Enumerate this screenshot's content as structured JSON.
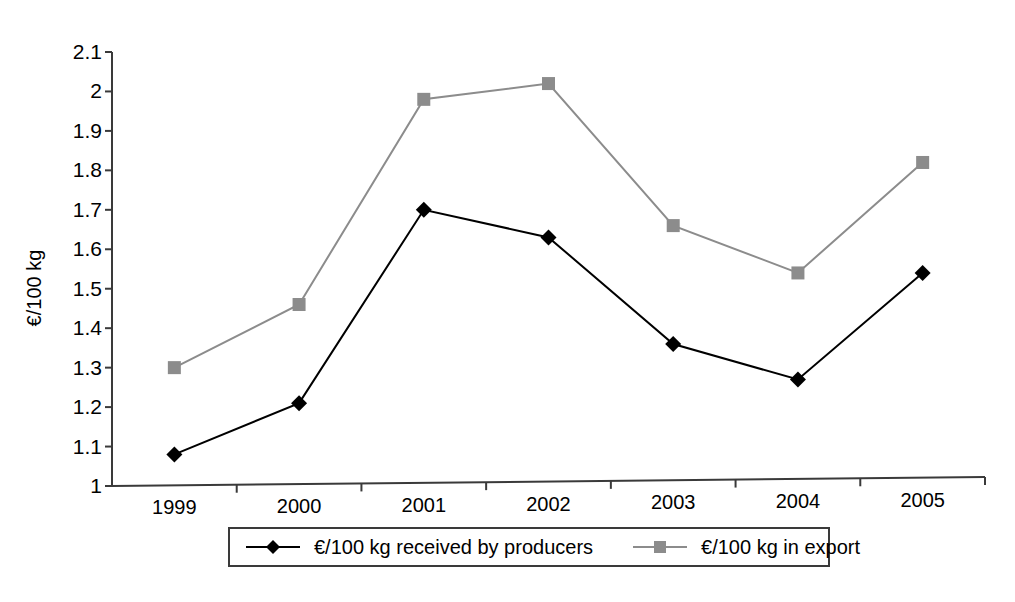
{
  "chart_data": {
    "type": "line",
    "title": "",
    "xlabel": "",
    "ylabel": "€/100 kg",
    "categories": [
      "1999",
      "2000",
      "2001",
      "2002",
      "2003",
      "2004",
      "2005"
    ],
    "ylim": [
      1,
      2.1
    ],
    "ytick_labels": [
      "1",
      "1.1",
      "1.2",
      "1.3",
      "1.4",
      "1.5",
      "1.6",
      "1.7",
      "1.8",
      "1.9",
      "2",
      "2.1"
    ],
    "ytick_values": [
      1,
      1.1,
      1.2,
      1.3,
      1.4,
      1.5,
      1.6,
      1.7,
      1.8,
      1.9,
      2.0,
      2.1
    ],
    "grid": false,
    "legend_position": "bottom",
    "series": [
      {
        "name": "€/100 kg received by producers",
        "marker": "diamond",
        "color": "#000000",
        "values": [
          1.08,
          1.21,
          1.7,
          1.63,
          1.36,
          1.27,
          1.54
        ]
      },
      {
        "name": "€/100 kg in export",
        "marker": "square",
        "color": "#8c8c8c",
        "values": [
          1.3,
          1.46,
          1.98,
          2.02,
          1.66,
          1.54,
          1.82
        ]
      }
    ]
  },
  "legend": {
    "entries": [
      {
        "label": "€/100 kg received by producers",
        "marker": "diamond-marker-icon",
        "color": "#000000"
      },
      {
        "label": "€/100 kg in export",
        "marker": "square-marker-icon",
        "color": "#8c8c8c"
      }
    ]
  },
  "colors": {
    "series_producers": "#000000",
    "series_export": "#8c8c8c",
    "axis": "#3a3a3a",
    "background": "#ffffff"
  }
}
